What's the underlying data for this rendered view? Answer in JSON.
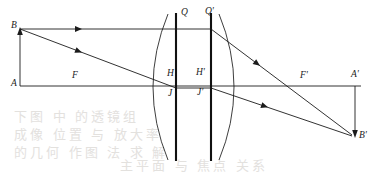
{
  "figure": {
    "type": "optics-ray-diagram",
    "width": 381,
    "height": 172,
    "background_color": "#ffffff",
    "stroke_color": "#1b1b1b",
    "plane_color": "#111111"
  },
  "labels": {
    "object_top": "B",
    "object_base": "A",
    "front_focus": "F",
    "back_focus": "F'",
    "principal_point_front": "H",
    "principal_point_back": "H'",
    "plane_top_front": "Q",
    "plane_top_back": "Q'",
    "plane_low_front": "J",
    "plane_low_back": "J'",
    "image_base": "A'",
    "image_top": "B'"
  },
  "label_positions": {
    "B": {
      "x": 12,
      "y": 23
    },
    "A": {
      "x": 12,
      "y": 81
    },
    "F": {
      "x": 72,
      "y": 73
    },
    "Q": {
      "x": 180,
      "y": 10
    },
    "Qp": {
      "x": 203,
      "y": 9
    },
    "H": {
      "x": 175,
      "y": 69
    },
    "Hp": {
      "x": 198,
      "y": 68
    },
    "J": {
      "x": 176,
      "y": 90
    },
    "Jp": {
      "x": 199,
      "y": 89
    },
    "Fp": {
      "x": 300,
      "y": 73
    },
    "Ap": {
      "x": 352,
      "y": 72
    },
    "Bp": {
      "x": 358,
      "y": 133
    }
  },
  "geometry": {
    "axis": {
      "x1": 20,
      "y1": 86,
      "x2": 361,
      "y2": 86
    },
    "object_arrow": {
      "x1": 20,
      "y1": 86,
      "x2": 20,
      "y2": 29
    },
    "image_arrow": {
      "x1": 355,
      "y1": 86,
      "x2": 355,
      "y2": 136
    },
    "plane_front": {
      "x": 176,
      "y_top": 13,
      "y_bottom": 161
    },
    "plane_back": {
      "x": 211,
      "y_top": 13,
      "y_bottom": 161
    },
    "lens_surface_front": {
      "x_vertex": 140,
      "x_edge": 168,
      "y_top": 14,
      "y_bottom": 160
    },
    "lens_surface_back": {
      "x_vertex": 248,
      "x_edge": 219,
      "y_top": 14,
      "y_bottom": 160
    },
    "ray_parallel_in": {
      "x1": 20,
      "y1": 29,
      "x2": 176,
      "y2": 29
    },
    "ray_parallel_jump": {
      "x1": 176,
      "y1": 29,
      "x2": 211,
      "y2": 29
    },
    "ray_parallel_out": {
      "x1": 211,
      "y1": 29,
      "x2": 352,
      "y2": 136
    },
    "ray_oblique_in": {
      "x1": 20,
      "y1": 29,
      "x2": 176,
      "y2": 88
    },
    "ray_oblique_jump": {
      "x1": 176,
      "y1": 88,
      "x2": 211,
      "y2": 88
    },
    "ray_oblique_out": {
      "x1": 211,
      "y1": 88,
      "x2": 352,
      "y2": 136
    }
  },
  "arrowheads": [
    {
      "name": "arrow-on-parallel-incident",
      "x": 80,
      "y": 29,
      "angle": 0
    },
    {
      "name": "arrow-on-oblique-incident",
      "x": 80,
      "y": 52,
      "angle": 20.7
    },
    {
      "name": "arrow-on-parallel-emergent",
      "x": 258,
      "y": 64,
      "angle": 37.2
    },
    {
      "name": "arrow-on-oblique-emergent",
      "x": 266,
      "y": 106,
      "angle": 18.8
    },
    {
      "name": "arrow-on-object-arrow",
      "x": 20,
      "y": 29,
      "angle": -90
    },
    {
      "name": "arrow-on-image-arrow",
      "x": 355,
      "y": 136,
      "angle": 90
    }
  ],
  "ghost_text_rows": [
    "下图   中   的透镜组",
    "成像  位置  与  放大率",
    "的几何  作图  法  求  解",
    "主平面  与  焦点  关系"
  ]
}
